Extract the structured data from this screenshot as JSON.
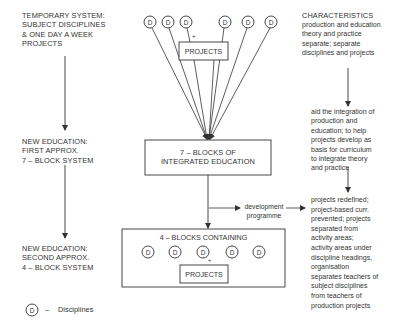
{
  "stages": [
    {
      "label": "TEMPORARY SYSTEM:\nSUBJECT DISCIPLINES\n& ONE DAY A WEEK\nPROJECTS"
    },
    {
      "label": "NEW EDUCATION:\nFIRST APPROX.\n7 – BLOCK SYSTEM"
    },
    {
      "label": "NEW EDUCATION:\nSECOND APPROX.\n4 – BLOCK SYSTEM"
    }
  ],
  "top_cluster": {
    "discipline_symbol": "D",
    "discipline_count": 6,
    "projects_label": "PROJECTS",
    "plus_mark": "+"
  },
  "box_7": {
    "label": "7 – BLOCKS OF\nINTEGRATED EDUCATION"
  },
  "box_4": {
    "label": "4 – BLOCKS CONTAINING",
    "discipline_symbol": "D",
    "discipline_count": 5,
    "plus_mark": "+",
    "projects_label": "PROJECTS"
  },
  "development": {
    "label": "development\nprogramme"
  },
  "characteristics": {
    "heading": "CHARACTERISTICS",
    "first": "production and education\ntheory and practice\nseparate; separate\ndisciplines and projects",
    "second": "aid the integration of\nproduction and\neducation;  to help\nprojects develop as\nbasis for curriculum\nto integrate theory\nand practice",
    "third": "projects redefined;\nproject-based curr.\nprevented;  projects\nseparated from\nactivity areas;\nactivity areas under\ndiscipline headings,\norganisation\nseparates teachers of\nsubject disciplines\nfrom teachers of\nproduction projects"
  },
  "legend": {
    "symbol": "D",
    "dash": "–",
    "label": "Disciplines"
  }
}
